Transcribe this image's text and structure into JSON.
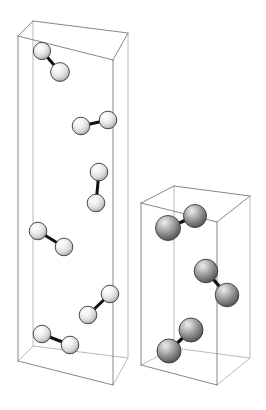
{
  "figure": {
    "background_color": "#ffffff",
    "edge_color": "#7a7a7a",
    "hidden_edge_color": "#a8a8a8",
    "bond_color": "#111111",
    "canvas": {
      "width": 266,
      "height": 410
    }
  },
  "cells": [
    {
      "name": "left-unit-cell",
      "label": "Left tall unit cell",
      "atom_style": "light",
      "atom_fill_light": "#ffffff",
      "atom_fill_mid": "#e4e4e4",
      "atom_fill_dark": "#9c9c9c",
      "atom_radius": 8.6,
      "bond_width": 3.0,
      "top_face": [
        {
          "x": 18.0,
          "y": 36.0
        },
        {
          "x": 33.0,
          "y": 21.0
        },
        {
          "x": 128.0,
          "y": 33.0
        },
        {
          "x": 113.0,
          "y": 60.0
        }
      ],
      "bottom_face": [
        {
          "x": 18.0,
          "y": 361.0
        },
        {
          "x": 33.0,
          "y": 346.0
        },
        {
          "x": 128.0,
          "y": 358.0
        },
        {
          "x": 113.0,
          "y": 385.0
        }
      ],
      "molecules": [
        {
          "name": "molecule-L1",
          "a": {
            "x": 42.0,
            "y": 51.0,
            "r": 8.6
          },
          "b": {
            "x": 60.0,
            "y": 72.0,
            "r": 9.4
          }
        },
        {
          "name": "molecule-L2",
          "a": {
            "x": 81.0,
            "y": 126.0,
            "r": 8.8
          },
          "b": {
            "x": 108.0,
            "y": 120.0,
            "r": 8.8
          }
        },
        {
          "name": "molecule-L3",
          "a": {
            "x": 99.0,
            "y": 172.0,
            "r": 8.8
          },
          "b": {
            "x": 96.0,
            "y": 203.0,
            "r": 8.8
          }
        },
        {
          "name": "molecule-L4",
          "a": {
            "x": 38.0,
            "y": 231.0,
            "r": 8.8
          },
          "b": {
            "x": 64.0,
            "y": 247.0,
            "r": 8.8
          }
        },
        {
          "name": "molecule-L5",
          "a": {
            "x": 88.0,
            "y": 315.0,
            "r": 8.8
          },
          "b": {
            "x": 110.0,
            "y": 294.0,
            "r": 8.8
          }
        },
        {
          "name": "molecule-L6",
          "a": {
            "x": 42.0,
            "y": 334.0,
            "r": 8.8
          },
          "b": {
            "x": 70.0,
            "y": 345.0,
            "r": 8.8
          }
        }
      ]
    },
    {
      "name": "right-unit-cell",
      "label": "Right short unit cell",
      "atom_style": "dark",
      "atom_fill_light": "#e8e8e8",
      "atom_fill_mid": "#b0b0b0",
      "atom_fill_dark": "#5e5e5e",
      "atom_radius": 11.5,
      "bond_width": 3.4,
      "top_face": [
        {
          "x": 141.0,
          "y": 203.0
        },
        {
          "x": 174.0,
          "y": 186.0
        },
        {
          "x": 250.0,
          "y": 196.0
        },
        {
          "x": 217.0,
          "y": 222.0
        }
      ],
      "bottom_face": [
        {
          "x": 141.0,
          "y": 365.0
        },
        {
          "x": 174.0,
          "y": 348.0
        },
        {
          "x": 250.0,
          "y": 358.0
        },
        {
          "x": 217.0,
          "y": 385.0
        }
      ],
      "molecules": [
        {
          "name": "molecule-R1",
          "a": {
            "x": 168.0,
            "y": 228.0,
            "r": 12.5
          },
          "b": {
            "x": 195.0,
            "y": 216.0,
            "r": 11.5
          }
        },
        {
          "name": "molecule-R2",
          "a": {
            "x": 206.0,
            "y": 271.0,
            "r": 11.8
          },
          "b": {
            "x": 227.0,
            "y": 295.0,
            "r": 11.8
          }
        },
        {
          "name": "molecule-R3",
          "a": {
            "x": 169.0,
            "y": 351.0,
            "r": 12.0
          },
          "b": {
            "x": 191.0,
            "y": 330.0,
            "r": 12.0
          }
        }
      ]
    }
  ]
}
